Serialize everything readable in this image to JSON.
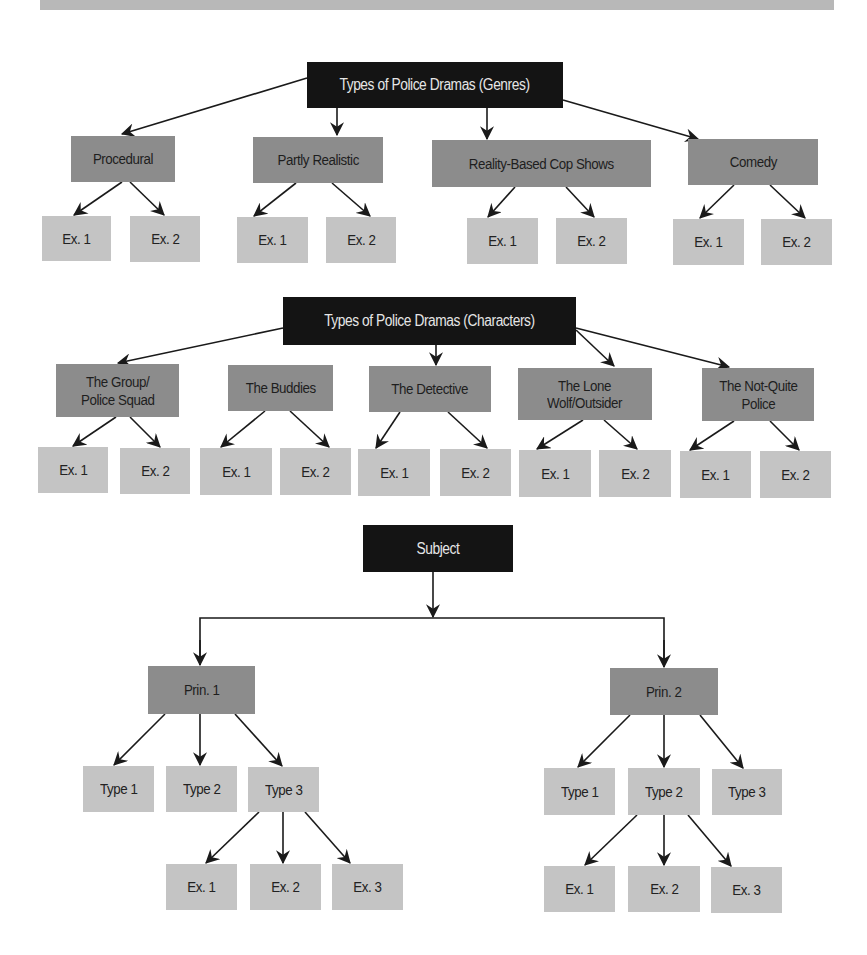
{
  "colors": {
    "root_fill": "#141414",
    "root_text": "#e6e6e6",
    "category_fill": "#8c8c8c",
    "leaf_fill": "#c4c4c4",
    "text_dark": "#1e1e1e",
    "arrow": "#1a1a1a",
    "top_bar": "#b8b8b8"
  },
  "genres": {
    "root": "Types of Police Dramas (Genres)",
    "categories": [
      {
        "label": "Procedural",
        "examples": [
          "Ex. 1",
          "Ex. 2"
        ]
      },
      {
        "label": "Partly Realistic",
        "examples": [
          "Ex. 1",
          "Ex. 2"
        ]
      },
      {
        "label": "Reality-Based Cop Shows",
        "examples": [
          "Ex. 1",
          "Ex. 2"
        ]
      },
      {
        "label": "Comedy",
        "examples": [
          "Ex. 1",
          "Ex. 2"
        ]
      }
    ]
  },
  "characters": {
    "root": "Types of Police Dramas (Characters)",
    "categories": [
      {
        "label": "The Group/\nPolice Squad",
        "examples": [
          "Ex. 1",
          "Ex. 2"
        ]
      },
      {
        "label": "The Buddies",
        "examples": [
          "Ex. 1",
          "Ex. 2"
        ]
      },
      {
        "label": "The Detective",
        "examples": [
          "Ex. 1",
          "Ex. 2"
        ]
      },
      {
        "label": "The Lone\nWolf/Outsider",
        "examples": [
          "Ex. 1",
          "Ex. 2"
        ]
      },
      {
        "label": "The Not-Quite\nPolice",
        "examples": [
          "Ex. 1",
          "Ex. 2"
        ]
      }
    ]
  },
  "subject": {
    "root": "Subject",
    "principles": [
      {
        "label": "Prin. 1",
        "types": [
          "Type 1",
          "Type 2",
          "Type 3"
        ],
        "expanded_type_index": 2,
        "examples": [
          "Ex. 1",
          "Ex. 2",
          "Ex. 3"
        ]
      },
      {
        "label": "Prin. 2",
        "types": [
          "Type 1",
          "Type 2",
          "Type 3"
        ],
        "expanded_type_index": 1,
        "examples": [
          "Ex. 1",
          "Ex. 2",
          "Ex. 3"
        ]
      }
    ]
  }
}
